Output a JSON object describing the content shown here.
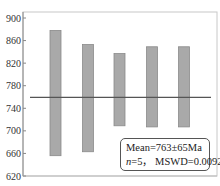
{
  "chart_data": {
    "type": "bar",
    "subtype": "weighted-mean-age-error-bars",
    "title": "",
    "xlabel": "",
    "ylabel": "",
    "ylim": [
      620,
      900
    ],
    "yticks": [
      620,
      660,
      700,
      740,
      780,
      820,
      860,
      900
    ],
    "grid": false,
    "categories": [
      "1",
      "2",
      "3",
      "4",
      "5"
    ],
    "series": [
      {
        "name": "age ranges",
        "color": "#a9a9a9",
        "lower": [
          656,
          663,
          709,
          707,
          707
        ],
        "upper": [
          878,
          853,
          837,
          849,
          849
        ]
      }
    ],
    "mean_line": {
      "value": 763,
      "color": "#555555"
    },
    "annotation": {
      "line1": "Mean=763±65Ma",
      "line2_prefix": "n",
      "line2_rest": "=5， MSWD=0.0092"
    },
    "legend_position": "lower right"
  }
}
